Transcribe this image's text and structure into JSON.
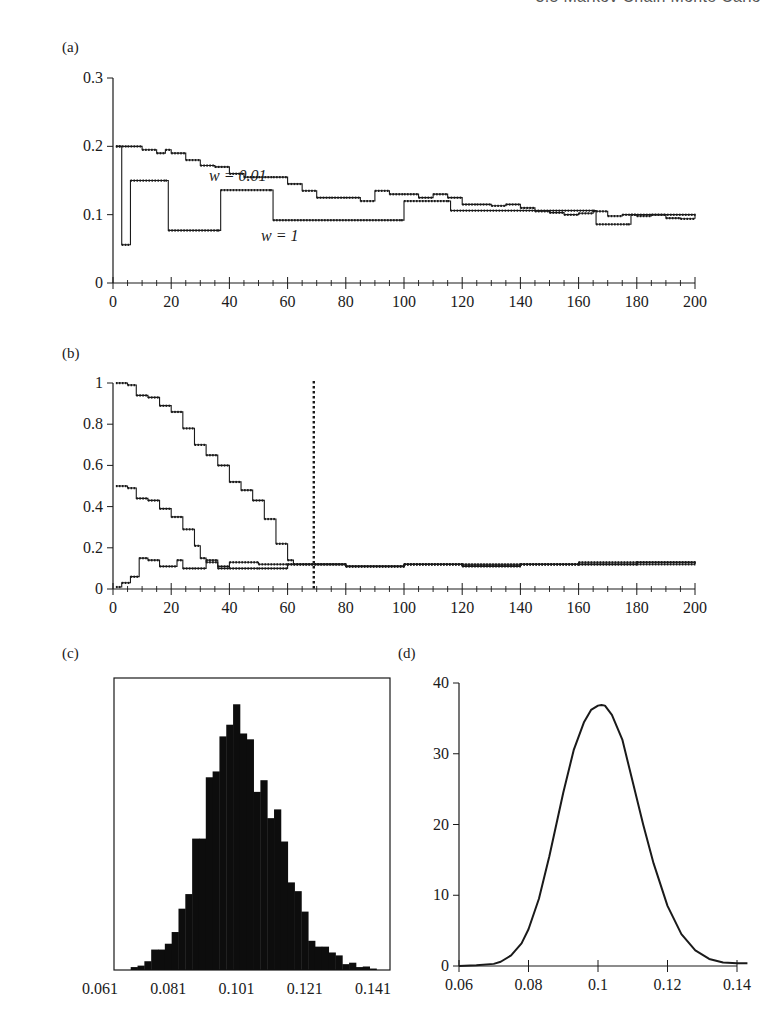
{
  "header": {
    "running_title": "3.5 Markov Chain Monte Carlo"
  },
  "panels": {
    "a": {
      "label": "(a)"
    },
    "b": {
      "label": "(b)"
    },
    "c": {
      "label": "(c)"
    },
    "d": {
      "label": "(d)"
    }
  },
  "chart_data": [
    {
      "id": "a",
      "type": "line",
      "title": "(a)",
      "xlabel": "",
      "ylabel": "",
      "xlim": [
        0,
        200
      ],
      "ylim": [
        0,
        0.3
      ],
      "xticks": [
        0,
        20,
        40,
        60,
        80,
        100,
        120,
        140,
        160,
        180,
        200
      ],
      "yticks": [
        0,
        0.1,
        0.2,
        0.3
      ],
      "grid": false,
      "annotations": [
        {
          "text": "w = 0.01",
          "x": 32,
          "y": 0.2
        },
        {
          "text": "w = 1",
          "x": 48,
          "y": 0.065
        }
      ],
      "series": [
        {
          "name": "w = 0.01",
          "x": [
            1,
            5,
            10,
            15,
            18,
            20,
            25,
            30,
            35,
            40,
            45,
            50,
            55,
            60,
            65,
            70,
            75,
            80,
            85,
            90,
            95,
            100,
            105,
            110,
            115,
            120,
            125,
            130,
            135,
            140,
            145,
            150,
            155,
            160,
            165,
            170,
            175,
            180,
            185,
            190,
            195,
            200
          ],
          "values": [
            0.2,
            0.2,
            0.195,
            0.19,
            0.195,
            0.19,
            0.18,
            0.172,
            0.17,
            0.16,
            0.155,
            0.155,
            0.155,
            0.145,
            0.135,
            0.125,
            0.125,
            0.125,
            0.12,
            0.135,
            0.13,
            0.13,
            0.125,
            0.13,
            0.125,
            0.115,
            0.115,
            0.113,
            0.115,
            0.11,
            0.105,
            0.103,
            0.1,
            0.102,
            0.105,
            0.098,
            0.1,
            0.098,
            0.1,
            0.095,
            0.094,
            0.094
          ]
        },
        {
          "name": "w = 1",
          "x": [
            1,
            2,
            3,
            5,
            6,
            18,
            19,
            36,
            37,
            54,
            55,
            99,
            100,
            115,
            116,
            165,
            166,
            177,
            178,
            200
          ],
          "values": [
            0.2,
            0.2,
            0.056,
            0.056,
            0.15,
            0.15,
            0.077,
            0.077,
            0.136,
            0.136,
            0.092,
            0.092,
            0.12,
            0.12,
            0.106,
            0.106,
            0.086,
            0.086,
            0.1,
            0.094
          ]
        }
      ]
    },
    {
      "id": "b",
      "type": "line",
      "title": "(b)",
      "xlabel": "",
      "ylabel": "",
      "xlim": [
        0,
        200
      ],
      "ylim": [
        0,
        1
      ],
      "xticks": [
        0,
        20,
        40,
        60,
        80,
        100,
        120,
        140,
        160,
        180,
        200
      ],
      "yticks": [
        0,
        0.2,
        0.4,
        0.6,
        0.8,
        1
      ],
      "grid": false,
      "annotations": [
        {
          "text": "burn-in cutoff (dotted vertical line)",
          "x": 69
        }
      ],
      "series": [
        {
          "name": "start 1.0",
          "x": [
            1,
            5,
            8,
            12,
            16,
            20,
            24,
            28,
            32,
            36,
            40,
            44,
            48,
            52,
            56,
            60,
            62,
            66,
            70,
            80,
            100,
            120,
            140,
            160,
            180,
            200
          ],
          "values": [
            1.0,
            0.99,
            0.94,
            0.93,
            0.89,
            0.86,
            0.78,
            0.7,
            0.65,
            0.6,
            0.52,
            0.48,
            0.43,
            0.34,
            0.22,
            0.14,
            0.12,
            0.12,
            0.12,
            0.11,
            0.12,
            0.115,
            0.12,
            0.12,
            0.13,
            0.125
          ]
        },
        {
          "name": "start 0.5",
          "x": [
            1,
            5,
            8,
            12,
            16,
            20,
            24,
            28,
            30,
            32,
            36,
            40,
            50,
            60,
            80,
            100,
            120,
            140,
            160,
            180,
            200
          ],
          "values": [
            0.5,
            0.49,
            0.44,
            0.43,
            0.39,
            0.35,
            0.29,
            0.21,
            0.15,
            0.13,
            0.11,
            0.1,
            0.1,
            0.12,
            0.11,
            0.12,
            0.11,
            0.12,
            0.12,
            0.13,
            0.12
          ]
        },
        {
          "name": "start 0.0",
          "x": [
            1,
            3,
            6,
            9,
            12,
            16,
            20,
            22,
            24,
            28,
            32,
            36,
            40,
            50,
            60,
            80,
            100,
            120,
            140,
            160,
            180,
            200
          ],
          "values": [
            0.01,
            0.03,
            0.06,
            0.15,
            0.14,
            0.11,
            0.11,
            0.14,
            0.1,
            0.1,
            0.14,
            0.1,
            0.13,
            0.12,
            0.12,
            0.11,
            0.12,
            0.12,
            0.12,
            0.13,
            0.12,
            0.12
          ]
        }
      ]
    },
    {
      "id": "c",
      "type": "bar",
      "subtype": "histogram",
      "title": "(c)",
      "xlabel": "",
      "ylabel": "",
      "xlim": [
        0.061,
        0.141
      ],
      "xticks": [
        0.061,
        0.081,
        0.101,
        0.121,
        0.141
      ],
      "yticks": [],
      "bin_width": 0.002,
      "categories": [
        0.071,
        0.073,
        0.075,
        0.077,
        0.079,
        0.081,
        0.083,
        0.085,
        0.087,
        0.089,
        0.091,
        0.093,
        0.095,
        0.097,
        0.099,
        0.101,
        0.103,
        0.105,
        0.107,
        0.109,
        0.111,
        0.113,
        0.115,
        0.117,
        0.119,
        0.121,
        0.123,
        0.125,
        0.127,
        0.129,
        0.131,
        0.133,
        0.135,
        0.137,
        0.139,
        0.141
      ],
      "values": [
        1,
        1.5,
        3,
        7,
        7,
        9,
        13,
        21,
        26,
        45,
        45,
        66,
        68,
        80,
        84,
        91,
        81,
        79,
        61,
        65,
        52,
        55,
        44,
        30,
        27,
        20,
        10,
        8,
        8,
        6,
        5,
        2,
        2.5,
        1,
        1.2,
        0.5
      ],
      "values_unit": "relative height (% of box)"
    },
    {
      "id": "d",
      "type": "line",
      "title": "(d)",
      "xlabel": "",
      "ylabel": "",
      "xlim": [
        0.06,
        0.14
      ],
      "ylim": [
        0,
        40
      ],
      "xticks": [
        0.06,
        0.08,
        0.1,
        0.12,
        0.14
      ],
      "yticks": [
        0,
        10,
        20,
        30,
        40
      ],
      "grid": false,
      "x": [
        0.06,
        0.065,
        0.07,
        0.072,
        0.075,
        0.078,
        0.08,
        0.083,
        0.086,
        0.09,
        0.093,
        0.096,
        0.098,
        0.1,
        0.101,
        0.102,
        0.104,
        0.107,
        0.11,
        0.113,
        0.116,
        0.12,
        0.124,
        0.128,
        0.132,
        0.136,
        0.14,
        0.143
      ],
      "values": [
        0,
        0.1,
        0.3,
        0.6,
        1.5,
        3.2,
        5.2,
        9.5,
        15.5,
        24.5,
        30.5,
        34.5,
        36.2,
        36.8,
        36.9,
        36.8,
        35.5,
        32,
        26,
        20,
        14.5,
        8.5,
        4.5,
        2.2,
        1,
        0.5,
        0.4,
        0.4
      ]
    }
  ]
}
